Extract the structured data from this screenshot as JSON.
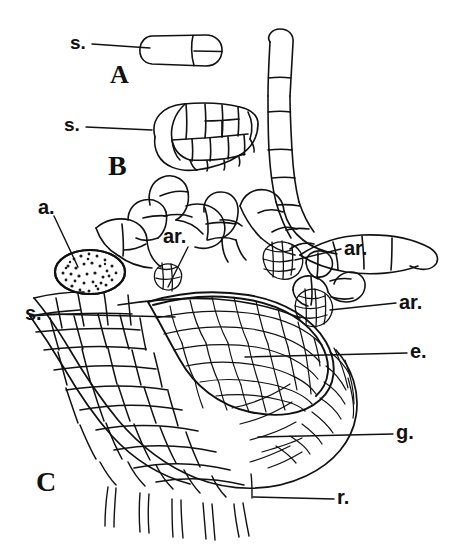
{
  "figure": {
    "type": "botanical-line-illustration",
    "background_color": "#ffffff",
    "ink_color": "#111111"
  },
  "panels": [
    {
      "key": "A",
      "label": "A",
      "x": 110,
      "y": 62,
      "font": "serif-bold",
      "size": 26,
      "description": "two-celled embryo / young gametophyte, outlined oblong with one transverse wall"
    },
    {
      "key": "B",
      "label": "B",
      "x": 108,
      "y": 152,
      "font": "serif-bold",
      "size": 28,
      "description": "multicellular oval embryo showing segmented cell plates"
    },
    {
      "key": "C",
      "label": "C",
      "x": 36,
      "y": 468,
      "font": "serif-bold",
      "size": 28,
      "description": "mature gametophyte in longitudinal section with rhizoids, archegonia, antheridium and embryo"
    }
  ],
  "labels": [
    {
      "id": "s-a",
      "text": "s.",
      "x": 70,
      "y": 33,
      "size": 19,
      "leader": {
        "x1": 92,
        "y1": 44,
        "x2": 150,
        "y2": 48
      },
      "target": "suspensor-cell-panel-A"
    },
    {
      "id": "s-b",
      "text": "s.",
      "x": 64,
      "y": 115,
      "size": 19,
      "leader": {
        "x1": 86,
        "y1": 127,
        "x2": 152,
        "y2": 130
      },
      "target": "suspensor-cell-panel-B"
    },
    {
      "id": "a",
      "text": "a.",
      "x": 38,
      "y": 197,
      "size": 20,
      "leader": {
        "x1": 54,
        "y1": 216,
        "x2": 78,
        "y2": 267
      },
      "target": "antheridium"
    },
    {
      "id": "ar-1",
      "text": "ar.",
      "x": 163,
      "y": 226,
      "size": 20,
      "leader": {
        "x1": 188,
        "y1": 247,
        "x2": 168,
        "y2": 287
      },
      "target": "archegonium-central"
    },
    {
      "id": "ar-2",
      "text": "ar.",
      "x": 344,
      "y": 238,
      "size": 20,
      "leader": {
        "x1": 341,
        "y1": 249,
        "x2": 295,
        "y2": 260
      },
      "target": "archegonium-upper-right"
    },
    {
      "id": "ar-3",
      "text": "ar.",
      "x": 399,
      "y": 292,
      "size": 20,
      "leader": {
        "x1": 396,
        "y1": 303,
        "x2": 330,
        "y2": 310
      },
      "target": "archegonium-lower-right"
    },
    {
      "id": "s-c",
      "text": "s.",
      "x": 25,
      "y": 303,
      "size": 20,
      "leader": {
        "x1": 48,
        "y1": 314,
        "x2": 175,
        "y2": 317
      },
      "target": "suspensor-panel-C"
    },
    {
      "id": "e",
      "text": "e.",
      "x": 410,
      "y": 341,
      "size": 20,
      "leader": {
        "x1": 407,
        "y1": 353,
        "x2": 245,
        "y2": 357
      },
      "target": "embryo"
    },
    {
      "id": "g",
      "text": "g.",
      "x": 396,
      "y": 422,
      "size": 20,
      "leader": {
        "x1": 393,
        "y1": 434,
        "x2": 258,
        "y2": 437
      },
      "target": "gametophyte-tissue"
    },
    {
      "id": "r",
      "text": "r.",
      "x": 337,
      "y": 487,
      "size": 20,
      "leader": {
        "x1": 334,
        "y1": 499,
        "x2": 253,
        "y2": 497
      },
      "target": "rhizoid"
    }
  ],
  "legend_meaning": {
    "s.": "suspensor",
    "a.": "antheridium",
    "ar.": "archegonium",
    "e.": "embryo",
    "g.": "gametophyte",
    "r.": "rhizoid"
  }
}
